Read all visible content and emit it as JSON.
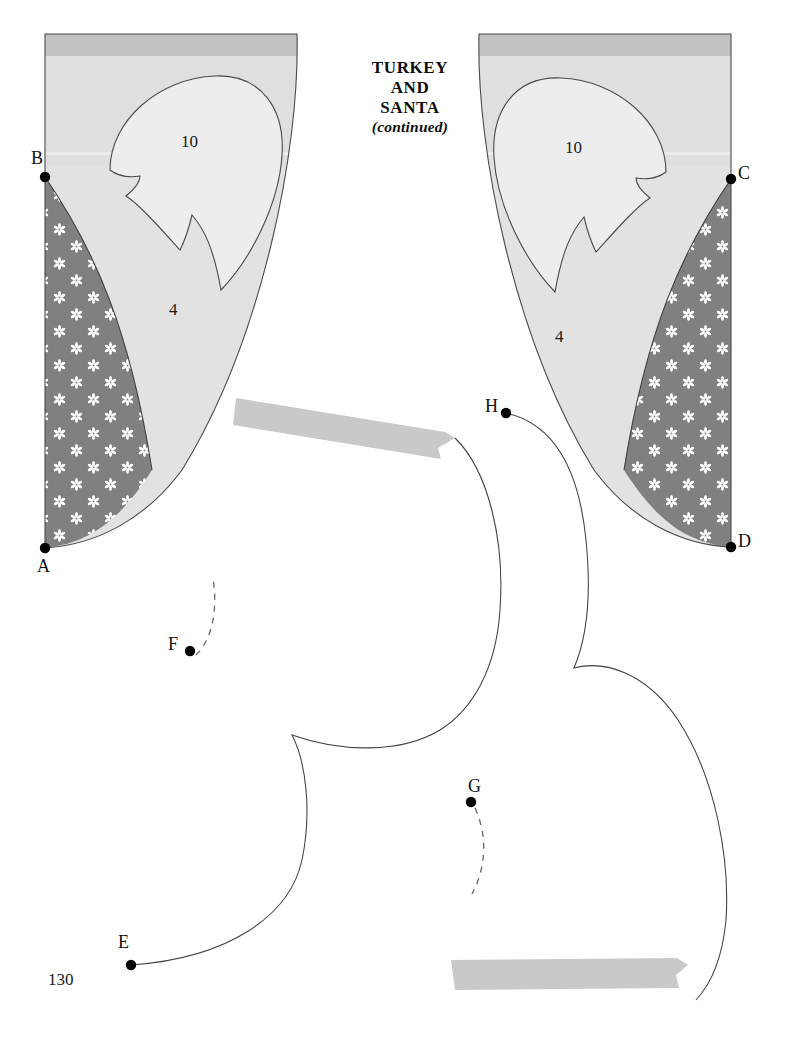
{
  "page": {
    "width": 788,
    "height": 1037,
    "background": "#ffffff",
    "page_number": "130"
  },
  "header": {
    "line1": "TURKEY",
    "line2": "AND",
    "line3": "SANTA",
    "continued": "(continued)"
  },
  "colors": {
    "paper": "#ffffff",
    "fabric_light": "#e2e2e2",
    "fabric_light_upper": "#dcdcdc",
    "fabric_top_strip": "#c2c2c2",
    "fabric_dark": "#808080",
    "motif": "#ffffff",
    "outline": "#3a3a3a",
    "ribbon": "#c9c9c9",
    "marker": "#000000",
    "text": "#111111"
  },
  "pattern_pieces": [
    {
      "id": "left-wing",
      "name": "left turkey wing piece",
      "piece_number": "10",
      "secondary_number": "4",
      "markers": [
        "B",
        "A"
      ]
    },
    {
      "id": "right-wing",
      "name": "right turkey wing piece",
      "piece_number": "10",
      "secondary_number": "4",
      "markers": [
        "C",
        "D"
      ]
    },
    {
      "id": "lower-body",
      "name": "lower scalloped body outline",
      "markers": [
        "E",
        "F",
        "G",
        "H"
      ]
    }
  ],
  "markers": [
    {
      "label": "A",
      "x": 45,
      "y": 548,
      "label_x": 38,
      "label_y": 566,
      "label_anchor": "below-left"
    },
    {
      "label": "B",
      "x": 45,
      "y": 177,
      "label_x": 32,
      "label_y": 156,
      "label_anchor": "above-left"
    },
    {
      "label": "C",
      "x": 731,
      "y": 179,
      "label_x": 737,
      "label_y": 170,
      "label_anchor": "right"
    },
    {
      "label": "D",
      "x": 731,
      "y": 547,
      "label_x": 737,
      "label_y": 538,
      "label_anchor": "right"
    },
    {
      "label": "E",
      "x": 131,
      "y": 965,
      "label_x": 119,
      "label_y": 938,
      "label_anchor": "above"
    },
    {
      "label": "F",
      "x": 190,
      "y": 651,
      "label_x": 169,
      "label_y": 639,
      "label_anchor": "left"
    },
    {
      "label": "G",
      "x": 471,
      "y": 802,
      "label_x": 470,
      "label_y": 780,
      "label_anchor": "above"
    },
    {
      "label": "H",
      "x": 506,
      "y": 413,
      "label_x": 487,
      "label_y": 401,
      "label_anchor": "left"
    }
  ],
  "piece_numbers": [
    {
      "value": "10",
      "x": 188,
      "y": 143
    },
    {
      "value": "4",
      "x": 174,
      "y": 311
    },
    {
      "value": "10",
      "x": 572,
      "y": 149
    },
    {
      "value": "4",
      "x": 560,
      "y": 338
    }
  ],
  "ribbons": [
    {
      "id": "ribbon-upper",
      "name": "upper gray banner tab"
    },
    {
      "id": "ribbon-lower",
      "name": "lower gray banner tab"
    }
  ],
  "dash_guides": [
    {
      "id": "dash-f",
      "name": "dashed placement guide at F"
    },
    {
      "id": "dash-g",
      "name": "dashed placement guide at G"
    }
  ]
}
